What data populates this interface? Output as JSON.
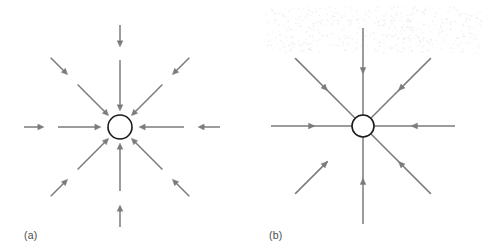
{
  "figure": {
    "width": 489,
    "height": 250,
    "background_color": "#ffffff",
    "arrow_color": "#7b7b7b",
    "circle_stroke_color": "#1a1a1a",
    "label_color": "#4b4b4b"
  },
  "panels": [
    {
      "id": "a",
      "label": "(a)",
      "center": {
        "x": 120,
        "y": 127
      },
      "circle_radius": 12,
      "arrow_style": "segmented-inward",
      "arrow_count": 8,
      "arrow_directions_deg": [
        0,
        45,
        90,
        135,
        180,
        225,
        270,
        315
      ],
      "segments_per_direction": 2,
      "arrows": [
        {
          "direction_deg": 180,
          "name": "arrow-from-left-outer",
          "from_r": 96,
          "to_r": 76,
          "points": "inward"
        },
        {
          "direction_deg": 180,
          "name": "arrow-from-left-inner",
          "from_r": 62,
          "to_r": 19,
          "points": "inward"
        },
        {
          "direction_deg": 135,
          "name": "arrow-from-upper-left-outer",
          "from_r": 98,
          "to_r": 74,
          "points": "inward"
        },
        {
          "direction_deg": 135,
          "name": "arrow-from-upper-left-inner",
          "from_r": 60,
          "to_r": 16,
          "points": "inward"
        },
        {
          "direction_deg": 90,
          "name": "arrow-from-top-outer",
          "from_r": 102,
          "to_r": 80,
          "points": "inward"
        },
        {
          "direction_deg": 90,
          "name": "arrow-from-top-inner",
          "from_r": 67,
          "to_r": 16,
          "points": "inward"
        },
        {
          "direction_deg": 45,
          "name": "arrow-from-upper-right-outer",
          "from_r": 98,
          "to_r": 74,
          "points": "inward"
        },
        {
          "direction_deg": 45,
          "name": "arrow-from-upper-right-inner",
          "from_r": 60,
          "to_r": 16,
          "points": "inward"
        },
        {
          "direction_deg": 0,
          "name": "arrow-from-right-outer",
          "from_r": 100,
          "to_r": 78,
          "points": "inward"
        },
        {
          "direction_deg": 0,
          "name": "arrow-from-right-inner",
          "from_r": 64,
          "to_r": 19,
          "points": "inward"
        },
        {
          "direction_deg": 315,
          "name": "arrow-from-lower-right-outer",
          "from_r": 98,
          "to_r": 74,
          "points": "inward"
        },
        {
          "direction_deg": 315,
          "name": "arrow-from-lower-right-inner",
          "from_r": 60,
          "to_r": 16,
          "points": "inward"
        },
        {
          "direction_deg": 270,
          "name": "arrow-from-bottom-outer",
          "from_r": 100,
          "to_r": 78,
          "points": "inward"
        },
        {
          "direction_deg": 270,
          "name": "arrow-from-bottom-inner",
          "from_r": 64,
          "to_r": 16,
          "points": "inward"
        },
        {
          "direction_deg": 225,
          "name": "arrow-from-lower-left-outer",
          "from_r": 98,
          "to_r": 74,
          "points": "inward"
        },
        {
          "direction_deg": 225,
          "name": "arrow-from-lower-left-inner",
          "from_r": 60,
          "to_r": 16,
          "points": "inward"
        }
      ]
    },
    {
      "id": "b",
      "label": "(b)",
      "center": {
        "x": 118,
        "y": 126
      },
      "circle_radius": 11,
      "arrow_style": "continuous-inward",
      "arrow_count": 8,
      "arrow_directions_deg": [
        0,
        45,
        90,
        135,
        180,
        225,
        270,
        315
      ],
      "segments_per_direction": 1,
      "arrows": [
        {
          "direction_deg": 180,
          "name": "ray-from-left",
          "from_r": 92,
          "to_r": 11,
          "arrowhead_at_r": 48,
          "points": "inward"
        },
        {
          "direction_deg": 135,
          "name": "ray-from-upper-left",
          "from_r": 96,
          "to_r": 11,
          "arrowhead_at_r": 50,
          "points": "inward"
        },
        {
          "direction_deg": 90,
          "name": "ray-from-top",
          "from_r": 98,
          "to_r": 11,
          "arrowhead_at_r": 52,
          "points": "inward"
        },
        {
          "direction_deg": 45,
          "name": "ray-from-upper-right",
          "from_r": 96,
          "to_r": 11,
          "arrowhead_at_r": 50,
          "points": "inward"
        },
        {
          "direction_deg": 0,
          "name": "ray-from-right",
          "from_r": 92,
          "to_r": 11,
          "arrowhead_at_r": 48,
          "points": "inward"
        },
        {
          "direction_deg": 315,
          "name": "ray-from-lower-right",
          "from_r": 96,
          "to_r": 11,
          "arrowhead_at_r": 50,
          "points": "inward"
        },
        {
          "direction_deg": 270,
          "name": "ray-from-bottom",
          "from_r": 98,
          "to_r": 11,
          "arrowhead_at_r": 52,
          "points": "inward"
        },
        {
          "direction_deg": 225,
          "name": "ray-from-lower-left",
          "from_r": 96,
          "to_r": 50,
          "arrowhead_at_r": 50,
          "points": "inward"
        }
      ]
    }
  ]
}
